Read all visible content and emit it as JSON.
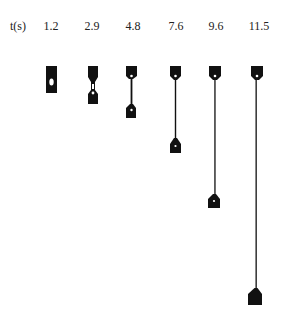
{
  "figure": {
    "axis_label": "t(s)",
    "times": [
      "1.2",
      "2.9",
      "4.8",
      "7.6",
      "9.6",
      "11.5"
    ],
    "specimens": [
      {
        "time": "1.2",
        "cx": 51,
        "top": 66,
        "bottom": 93
      },
      {
        "time": "2.9",
        "cx": 93,
        "top": 66,
        "bottom": 104
      },
      {
        "time": "4.8",
        "cx": 131,
        "top": 66,
        "bottom": 118
      },
      {
        "time": "7.6",
        "cx": 175,
        "top": 66,
        "bottom": 153
      },
      {
        "time": "9.6",
        "cx": 214,
        "top": 66,
        "bottom": 208
      },
      {
        "time": "11.5",
        "cx": 257,
        "top": 66,
        "bottom": 305
      }
    ],
    "ink_color": "#111111"
  }
}
